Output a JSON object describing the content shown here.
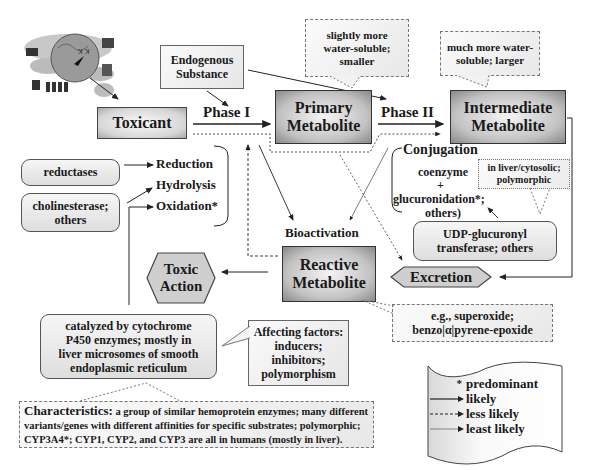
{
  "diagram": {
    "nodes": {
      "endogenous": {
        "line1": "Endogenous",
        "line2": "Substance"
      },
      "toxicant": {
        "label": "Toxicant"
      },
      "primary": {
        "line1": "Primary",
        "line2": "Metabolite"
      },
      "intermediate": {
        "line1": "Intermediate",
        "line2": "Metabolite"
      },
      "reactive": {
        "line1": "Reactive",
        "line2": "Metabolite"
      },
      "toxic_action": {
        "line1": "Toxic",
        "line2": "Action"
      },
      "excretion": {
        "label": "Excretion"
      },
      "reductases": {
        "label": "reductases"
      },
      "cholinesterase": {
        "line1": "cholinesterase;",
        "line2": "others"
      },
      "cyp450": {
        "line1": "catalyzed by cytochrome",
        "line2": "P450 enzymes; mostly in",
        "line3": "liver microsomes of smooth",
        "line4": "endoplasmic reticulum"
      },
      "udp": {
        "line1": "UDP-glucuronyl",
        "line2": "transferase; others"
      }
    },
    "edge_labels": {
      "phase1": "Phase I",
      "phase2": "Phase II",
      "bioactivation": "Bioactivation",
      "reduction": "Reduction",
      "hydrolysis": "Hydrolysis",
      "oxidation": "Oxidation*",
      "conjugation": "Conjugation",
      "coenzyme": "coenzyme",
      "plus": "+",
      "glucuronidation": "glucuronidation*;",
      "others_paren": "others)"
    },
    "callouts": {
      "slightly": {
        "line1": "slightly more",
        "line2": "water-soluble;",
        "line3": "smaller"
      },
      "much": {
        "line1": "much more water-",
        "line2": "soluble; larger"
      },
      "liver": {
        "line1": "in liver/cytosolic;",
        "line2": "polymorphic"
      },
      "eg": {
        "line1": "e.g., superoxide;",
        "line2": "benzo|α|pyrene-epoxide"
      },
      "affecting": {
        "line1": "Affecting factors:",
        "line2": "inducers;",
        "line3": "inhibitors;",
        "line4": "polymorphism"
      },
      "characteristics": {
        "heading": "Characteristics:",
        "line1": " a group of similar hemoprotein enzymes; many different",
        "line2": "variants/genes with different affinities for specific substrates; polymorphic;",
        "line3": "CYP3A4*; CYP1, CYP2, and CYP3 are all in humans (mostly in liver)."
      }
    },
    "legend": {
      "items": [
        {
          "symbol": "*",
          "label": "predominant"
        },
        {
          "symbol": "solid-arrow",
          "label": "likely"
        },
        {
          "symbol": "dashed-arrow",
          "label": "less likely"
        },
        {
          "symbol": "thin-arrow",
          "label": "least likely"
        }
      ]
    },
    "colors": {
      "box_border": "#444444",
      "box_fill": "#d6d6d6",
      "line": "#222222"
    }
  }
}
